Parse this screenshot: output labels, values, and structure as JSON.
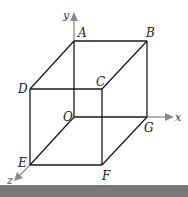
{
  "diagram": {
    "type": "cube-3d-axes",
    "colors": {
      "edge": "#1a1a1a",
      "axis": "#8a8a8a",
      "bar": "#7a7a7a"
    },
    "vertices": {
      "A": {
        "label": "A",
        "x": 74,
        "y": 41
      },
      "B": {
        "label": "B",
        "x": 147,
        "y": 41
      },
      "C": {
        "label": "C",
        "x": 102,
        "y": 89
      },
      "D": {
        "label": "D",
        "x": 30,
        "y": 89
      },
      "O": {
        "label": "O",
        "x": 74,
        "y": 117
      },
      "G": {
        "label": "G",
        "x": 147,
        "y": 117
      },
      "E": {
        "label": "E",
        "x": 30,
        "y": 165
      },
      "F": {
        "label": "F",
        "x": 102,
        "y": 165
      }
    },
    "axes": {
      "x": {
        "label": "x"
      },
      "y": {
        "label": "y"
      },
      "z": {
        "label": "z"
      }
    },
    "edges": [
      [
        "A",
        "B"
      ],
      [
        "D",
        "C"
      ],
      [
        "A",
        "D"
      ],
      [
        "B",
        "C"
      ],
      [
        "O",
        "G"
      ],
      [
        "E",
        "F"
      ],
      [
        "O",
        "E"
      ],
      [
        "G",
        "F"
      ],
      [
        "A",
        "O"
      ],
      [
        "B",
        "G"
      ],
      [
        "D",
        "E"
      ],
      [
        "C",
        "F"
      ]
    ]
  }
}
